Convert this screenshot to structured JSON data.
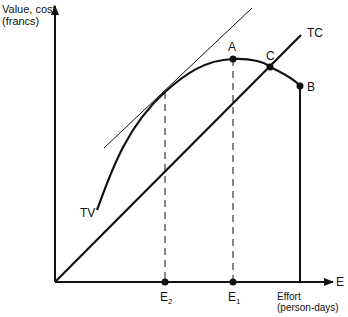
{
  "diagram": {
    "y_axis_label_line1": "Value, cost",
    "y_axis_label_line2": "(francs)",
    "x_axis_symbol": "E",
    "x_axis_label_line1": "Effort",
    "x_axis_label_line2": "(person-days)",
    "curves": {
      "tv_label": "TV",
      "tc_label": "TC"
    },
    "points": {
      "a": "A",
      "b": "B",
      "c": "C"
    },
    "ticks": {
      "e1_main": "E",
      "e1_sub": "1",
      "e2_main": "E",
      "e2_sub": "2"
    }
  }
}
